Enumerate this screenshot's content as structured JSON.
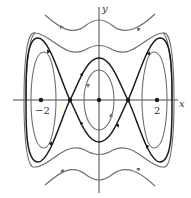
{
  "diagram": {
    "type": "phase-portrait",
    "axes": {
      "x_label": "x",
      "y_label": "y",
      "tick_labels": [
        "−2",
        "2"
      ]
    },
    "equilibria": [
      {
        "x": -2,
        "kind": "center"
      },
      {
        "x": -1,
        "kind": "saddle"
      },
      {
        "x": 0,
        "kind": "center"
      },
      {
        "x": 1,
        "kind": "saddle"
      },
      {
        "x": 2,
        "kind": "center"
      }
    ],
    "colors": {
      "separatrix": "#1a1a1a",
      "orbit": "#6e6e6e",
      "axis": "#333333"
    }
  }
}
